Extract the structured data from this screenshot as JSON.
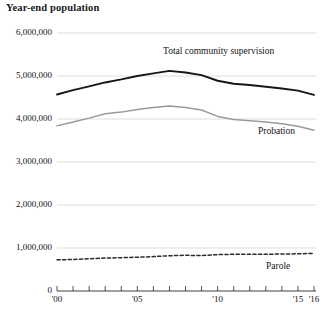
{
  "chart_data": {
    "type": "line",
    "title": "Year-end population",
    "xlabel": "",
    "ylabel": "",
    "ylim": [
      0,
      6000000
    ],
    "xlim": [
      2000,
      2016
    ],
    "grid": true,
    "legend_position": "inline-annotations",
    "x": [
      2000,
      2001,
      2002,
      2003,
      2004,
      2005,
      2006,
      2007,
      2008,
      2009,
      2010,
      2011,
      2012,
      2013,
      2014,
      2015,
      2016
    ],
    "x_tick_labels": [
      "'00",
      "'01",
      "'02",
      "'03",
      "'04",
      "'05",
      "'06",
      "'07",
      "'08",
      "'09",
      "'10",
      "'11",
      "'12",
      "'13",
      "'14",
      "'15",
      "'16"
    ],
    "x_tick_labels_shown": [
      {
        "x": 2000,
        "label": "'00"
      },
      {
        "x": 2005,
        "label": "'05"
      },
      {
        "x": 2010,
        "label": "'10"
      },
      {
        "x": 2015,
        "label": "'15"
      },
      {
        "x": 2016,
        "label": "'16"
      }
    ],
    "y_tick_labels": [
      "0",
      "1,000,000",
      "2,000,000",
      "3,000,000",
      "4,000,000",
      "5,000,000",
      "6,000,000"
    ],
    "y_ticks": [
      0,
      1000000,
      2000000,
      3000000,
      4000000,
      5000000,
      6000000
    ],
    "series": [
      {
        "name": "Total community supervision",
        "color": "#171717",
        "style": "solid",
        "label_text": "Total community supervision",
        "values": [
          4570000,
          4670000,
          4760000,
          4850000,
          4920000,
          5000000,
          5060000,
          5120000,
          5080000,
          5020000,
          4890000,
          4820000,
          4790000,
          4750000,
          4710000,
          4660000,
          4560000
        ]
      },
      {
        "name": "Probation",
        "color": "#9a9a9a",
        "style": "solid",
        "label_text": "Probation",
        "values": [
          3840000,
          3930000,
          4020000,
          4120000,
          4160000,
          4220000,
          4270000,
          4300000,
          4270000,
          4210000,
          4060000,
          3990000,
          3960000,
          3930000,
          3890000,
          3830000,
          3740000
        ]
      },
      {
        "name": "Parole",
        "color": "#2b2b2b",
        "style": "dashed",
        "label_text": "Parole",
        "values": [
          725000,
          732000,
          750000,
          765000,
          775000,
          785000,
          800000,
          820000,
          830000,
          825000,
          845000,
          855000,
          855000,
          855000,
          860000,
          865000,
          875000
        ]
      }
    ]
  },
  "axis_labels": {
    "y": [
      "6,000,000",
      "5,000,000",
      "4,000,000",
      "3,000,000",
      "2,000,000",
      "1,000,000",
      "0"
    ],
    "x": [
      "'00",
      "'05",
      "'10",
      "'15",
      "'16"
    ]
  }
}
